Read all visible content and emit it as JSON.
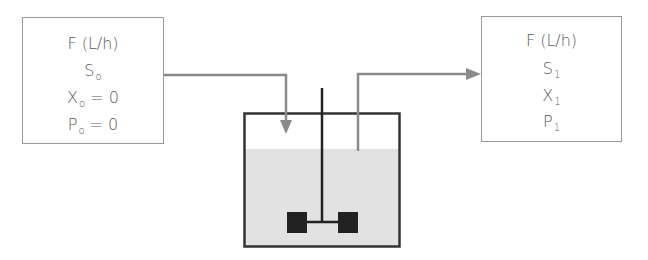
{
  "diagram": {
    "inlet": {
      "label": "inlet-stream",
      "lines": [
        {
          "main": "F (L/h)",
          "sub": ""
        },
        {
          "main": "S",
          "sub": "o",
          "suffix": ""
        },
        {
          "main": "X",
          "sub": "o",
          "suffix": " = 0"
        },
        {
          "main": "P",
          "sub": "o",
          "suffix": " = 0"
        }
      ]
    },
    "outlet": {
      "label": "outlet-stream",
      "lines": [
        {
          "main": "F (L/h)",
          "sub": ""
        },
        {
          "main": "S",
          "sub": "1",
          "suffix": ""
        },
        {
          "main": "X",
          "sub": "1",
          "suffix": ""
        },
        {
          "main": "P",
          "sub": "1",
          "suffix": ""
        }
      ]
    },
    "colors": {
      "box_border": "#9a9a9a",
      "arrow": "#8a8a8a",
      "tank_border": "#333333",
      "liquid": "#e2e2e2",
      "impeller": "#222222",
      "text": "#5a5a5a"
    }
  }
}
